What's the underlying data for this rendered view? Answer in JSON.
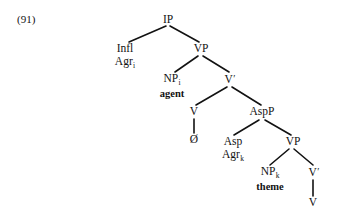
{
  "example": {
    "number": "(91)"
  },
  "tree": {
    "title": "syntax-tree-91",
    "line_color": "#121212",
    "text_color": "#121212",
    "nodes": {
      "ip": {
        "label": "IP"
      },
      "infl": {
        "label": "Infl",
        "second_line": "Agr",
        "subscript": "i"
      },
      "vp_top": {
        "label": "VP"
      },
      "np_agent": {
        "label": "NP",
        "subscript": "i",
        "role": "agent"
      },
      "vbar_top": {
        "label": "V",
        "prime": "′"
      },
      "v_upper": {
        "label": "V"
      },
      "null_head": {
        "label": "Ø"
      },
      "aspp": {
        "label": "AspP"
      },
      "asp": {
        "label": "Asp",
        "second_line": "Agr",
        "subscript": "k"
      },
      "vp_low": {
        "label": "VP"
      },
      "np_theme": {
        "label": "NP",
        "subscript": "k",
        "role": "theme"
      },
      "vbar_low": {
        "label": "V",
        "prime": "′"
      },
      "v_bottom": {
        "label": "V"
      }
    }
  }
}
